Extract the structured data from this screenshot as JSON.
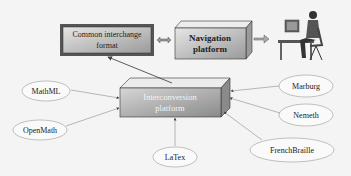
{
  "diagram": {
    "common_format": {
      "line1": "Common interchange",
      "line2": "format"
    },
    "navigation": {
      "line1": "Navigation",
      "line2": "platform"
    },
    "interconversion": {
      "line1": "Interconversion",
      "line2": "platform"
    },
    "inputs": {
      "mathml": "MathML",
      "openmath": "OpenMath",
      "latex": "LaTex",
      "marburg": "Marburg",
      "nemeth": "Nemeth",
      "frenchbraille": "FrenchBraille"
    },
    "user_icon": "person-at-computer-icon"
  }
}
